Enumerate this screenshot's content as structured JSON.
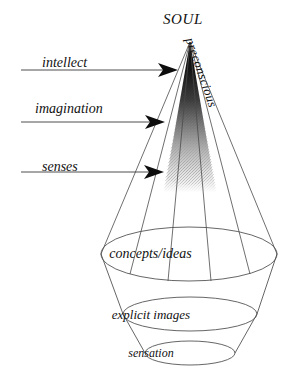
{
  "figure": {
    "title": "SOUL",
    "apex_label": "SOUL",
    "side_label": "preconscious"
  },
  "inputs": [
    {
      "label": "intellect",
      "arrow": "arrow-right-icon"
    },
    {
      "label": "imagination",
      "arrow": "arrow-right-icon"
    },
    {
      "label": "senses",
      "arrow": "arrow-right-icon"
    }
  ],
  "levels": [
    {
      "label": "concepts/ideas"
    },
    {
      "label": "explicit  images"
    },
    {
      "label": "sensation"
    }
  ],
  "colors": {
    "ink": "#111111",
    "line": "#444444",
    "background": "#ffffff",
    "cone_dark": "#0a0a0a",
    "cone_light": "#ffffff"
  }
}
